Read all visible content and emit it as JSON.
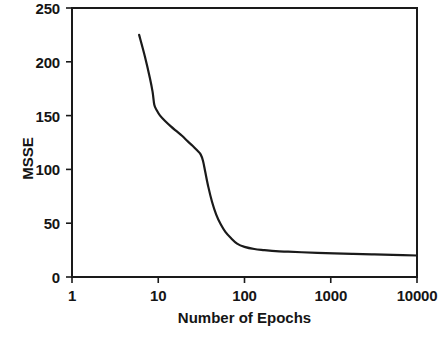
{
  "chart_data": {
    "type": "line",
    "title": "",
    "subtitle": "",
    "xlabel": "Number of Epochs",
    "ylabel": "MSSE",
    "xscale": "log",
    "yscale": "linear",
    "xlim": [
      1,
      10000
    ],
    "ylim": [
      0,
      250
    ],
    "grid": false,
    "legend": false,
    "legend_position": "none",
    "xticks": [
      {
        "value": 1,
        "label": "1"
      },
      {
        "value": 10,
        "label": "10"
      },
      {
        "value": 100,
        "label": "100"
      },
      {
        "value": 1000,
        "label": "1000"
      },
      {
        "value": 10000,
        "label": "10000"
      }
    ],
    "yticks": [
      {
        "value": 0,
        "label": "0"
      },
      {
        "value": 50,
        "label": "50"
      },
      {
        "value": 100,
        "label": "100"
      },
      {
        "value": 150,
        "label": "150"
      },
      {
        "value": 200,
        "label": "200"
      },
      {
        "value": 250,
        "label": "250"
      }
    ],
    "series": [
      {
        "name": "MSSE",
        "color": "#1a1a1a",
        "line_width": 2.2,
        "markers": false,
        "x": [
          6,
          7,
          8,
          8.6,
          9,
          9.6,
          10.5,
          12,
          14,
          16,
          19,
          22,
          25,
          28,
          31,
          33,
          35,
          38,
          42,
          47,
          53,
          60,
          70,
          82,
          100,
          130,
          170,
          230,
          320,
          460,
          700,
          1100,
          1800,
          3000,
          5200,
          10000
        ],
        "y": [
          225,
          205,
          185,
          172,
          160,
          155,
          150,
          145,
          140,
          136,
          131,
          126,
          122,
          118,
          114,
          108,
          98,
          84,
          70,
          58,
          49,
          42,
          36,
          31,
          28,
          26,
          25,
          24,
          23.5,
          23,
          22.5,
          22,
          21.5,
          21,
          20.5,
          20
        ]
      }
    ],
    "annotations": []
  },
  "axis": {
    "y_title": "MSSE",
    "x_title": "Number of Epochs"
  }
}
